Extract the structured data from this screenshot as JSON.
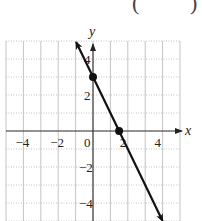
{
  "header_fragment": {
    "left": "(",
    "middle": "−",
    "right": ")"
  },
  "chart_data": {
    "type": "line",
    "title": "",
    "xlabel": "x",
    "ylabel": "y",
    "xlim": [
      -5,
      5
    ],
    "ylim": [
      -5,
      5
    ],
    "grid": true,
    "xticks": [
      -4,
      -2,
      0,
      2,
      4
    ],
    "yticks": [
      -4,
      -2,
      2,
      4
    ],
    "xtick_labels": [
      "−4",
      "−2",
      "0",
      "2",
      "4"
    ],
    "ytick_labels": [
      "−4",
      "−2",
      "2",
      "4"
    ],
    "series": [
      {
        "name": "y = -2x + 3",
        "equation": "y = -2x + 3",
        "x": [
          -0.97,
          4
        ],
        "y": [
          4.94,
          -5
        ],
        "arrows_both_ends": true
      }
    ],
    "points": [
      {
        "label": "y-intercept",
        "x": 0,
        "y": 3
      },
      {
        "label": "x-intercept",
        "x": 1.5,
        "y": 0
      }
    ],
    "colors": {
      "line": "#111111",
      "grid": "#b5b5b5",
      "axis": "#333333"
    }
  }
}
